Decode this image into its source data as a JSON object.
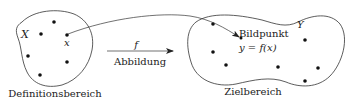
{
  "diagram": {
    "domain": {
      "set_label": "X",
      "element_label": "x",
      "caption": "Definitionsbereich"
    },
    "mapping": {
      "symbol": "f",
      "caption": "Abbildung"
    },
    "codomain": {
      "set_label": "Y",
      "image_caption": "Bildpunkt",
      "image_formula": "y = f(x)",
      "caption": "Zielbereich"
    },
    "colors": {
      "stroke": "#333333",
      "text": "#222222",
      "background": "#ffffff"
    }
  }
}
